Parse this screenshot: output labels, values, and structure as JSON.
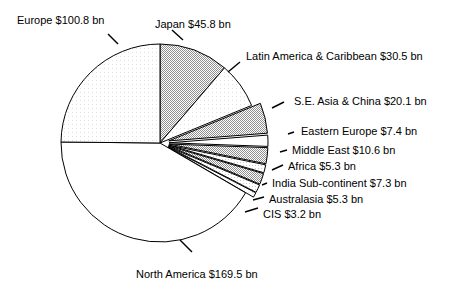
{
  "chart_data": {
    "type": "pie",
    "title": "",
    "subtitle": "",
    "xlabel": "",
    "ylabel": "",
    "units": "bn",
    "currency": "$",
    "total": 405.8,
    "legend_position": "none",
    "grid": false,
    "start_angle_deg": -90,
    "direction": "clockwise",
    "categories": [
      "Japan",
      "Latin America & Caribbean",
      "S.E. Asia & China",
      "Eastern Europe",
      "Middle East",
      "Africa",
      "India Sub-continent",
      "Australasia",
      "CIS",
      "North America",
      "Europe"
    ],
    "values": [
      45.8,
      30.5,
      20.1,
      7.4,
      10.6,
      5.3,
      7.3,
      5.3,
      3.2,
      169.5,
      100.8
    ],
    "slices": [
      {
        "name": "Japan",
        "label": "Japan $45.8 bn",
        "value": 45.8,
        "fill": "#b8b8b8",
        "exploded": false,
        "label_x": 155,
        "label_y": 18,
        "leader": [
          183,
          40,
          172,
          30
        ]
      },
      {
        "name": "Latin America & Caribbean",
        "label": "Latin America & Caribbean $30.5 bn",
        "value": 30.5,
        "fill": "#f2f2f2",
        "exploded": false,
        "label_x": 246,
        "label_y": 50,
        "leader": [
          228,
          72,
          240,
          62
        ]
      },
      {
        "name": "S.E. Asia & China",
        "label": "S.E. Asia & China $20.1 bn",
        "value": 20.1,
        "fill": "#b8b8b8",
        "exploded": true,
        "label_x": 294,
        "label_y": 95,
        "leader": [
          272,
          108,
          284,
          102
        ]
      },
      {
        "name": "Eastern Europe",
        "label": "Eastern Europe $7.4 bn",
        "value": 7.4,
        "fill": "#ffffff",
        "exploded": true,
        "label_x": 301,
        "label_y": 125,
        "leader": [
          288,
          134,
          294,
          132
        ]
      },
      {
        "name": "Middle East",
        "label": "Middle East $10.6 bn",
        "value": 10.6,
        "fill": "#c4c4c4",
        "exploded": true,
        "label_x": 292,
        "label_y": 144,
        "leader": [
          280,
          152,
          287,
          150
        ]
      },
      {
        "name": "Africa",
        "label": "Africa $5.3 bn",
        "value": 5.3,
        "fill": "#d8d8d8",
        "exploded": true,
        "label_x": 288,
        "label_y": 160,
        "leader": [
          272,
          170,
          283,
          165
        ]
      },
      {
        "name": "India Sub-continent",
        "label": "India Sub-continent $7.3 bn",
        "value": 7.3,
        "fill": "#c4c4c4",
        "exploded": true,
        "label_x": 272,
        "label_y": 177,
        "leader": [
          262,
          185,
          267,
          183
        ]
      },
      {
        "name": "Australasia",
        "label": "Australasia $5.3 bn",
        "value": 5.3,
        "fill": "#d8d8d8",
        "exploded": true,
        "label_x": 269,
        "label_y": 193,
        "leader": [
          253,
          200,
          264,
          197
        ]
      },
      {
        "name": "CIS",
        "label": "CIS $3.2 bn",
        "value": 3.2,
        "fill": "#e8e8e8",
        "exploded": true,
        "label_x": 263,
        "label_y": 208,
        "leader": [
          245,
          212,
          258,
          208
        ]
      },
      {
        "name": "North America",
        "label": "North America $169.5 bn",
        "value": 169.5,
        "fill": "#ffffff",
        "exploded": false,
        "label_x": 136,
        "label_y": 268,
        "leader": [
          180,
          240,
          192,
          252
        ]
      },
      {
        "name": "Europe",
        "label": "Europe $100.8 bn",
        "value": 100.8,
        "fill": "#f0f0f0",
        "exploded": false,
        "label_x": 17,
        "label_y": 14,
        "leader": [
          118,
          44,
          108,
          34
        ]
      }
    ]
  },
  "geometry": {
    "cx": 160,
    "cy": 143,
    "r": 99
  }
}
